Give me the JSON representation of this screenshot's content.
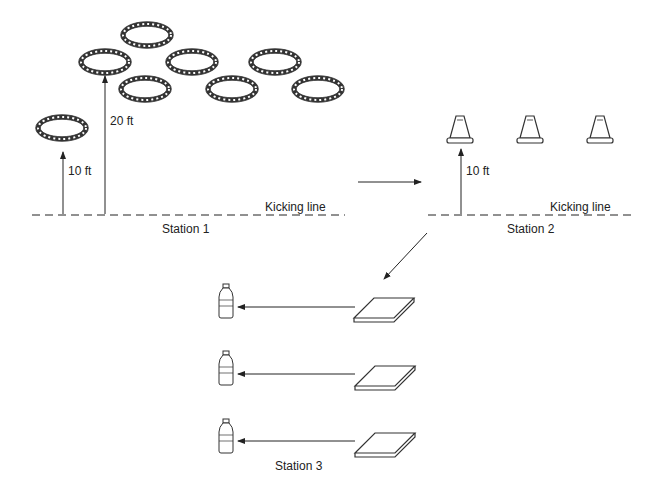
{
  "station1": {
    "name": "Station 1",
    "kicking_line": "Kicking line",
    "dist_near": "10 ft",
    "dist_far": "20 ft",
    "rings": 8
  },
  "station2": {
    "name": "Station 2",
    "kicking_line": "Kicking line",
    "dist": "10 ft",
    "cones": 3
  },
  "station3": {
    "name": "Station 3",
    "lanes": 3
  }
}
